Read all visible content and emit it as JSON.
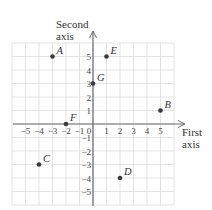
{
  "diagram": {
    "type": "coordinate-plane",
    "x_axis_label": [
      "First",
      "axis"
    ],
    "y_axis_label": [
      "Second",
      "axis"
    ],
    "range": {
      "xmin": -6,
      "xmax": 6,
      "ymin": -6,
      "ymax": 6
    },
    "x_ticks": [
      -5,
      -4,
      -3,
      -2,
      -1,
      0,
      1,
      2,
      3,
      4,
      5
    ],
    "y_ticks": [
      -5,
      -4,
      -3,
      -2,
      -1,
      1,
      2,
      3,
      4,
      5
    ],
    "x_tick_labels": [
      "−5",
      "−4",
      "−3",
      "−2",
      "−1",
      "0",
      "1",
      "2",
      "3",
      "4",
      "5"
    ],
    "y_tick_labels": [
      "−5",
      "−4",
      "−3",
      "−2",
      "−1",
      "1",
      "2",
      "3",
      "4",
      "5"
    ],
    "points": [
      {
        "label": "A",
        "x": -3,
        "y": 5
      },
      {
        "label": "B",
        "x": 5,
        "y": 1
      },
      {
        "label": "C",
        "x": -4,
        "y": -3
      },
      {
        "label": "D",
        "x": 2,
        "y": -4
      },
      {
        "label": "E",
        "x": 1,
        "y": 5
      },
      {
        "label": "F",
        "x": -2,
        "y": 0
      },
      {
        "label": "G",
        "x": 0,
        "y": 3
      }
    ],
    "colors": {
      "grid": "#dcdcdc",
      "axis": "#6a6a6a",
      "point": "#3a3a3a",
      "text": "#333333"
    }
  }
}
